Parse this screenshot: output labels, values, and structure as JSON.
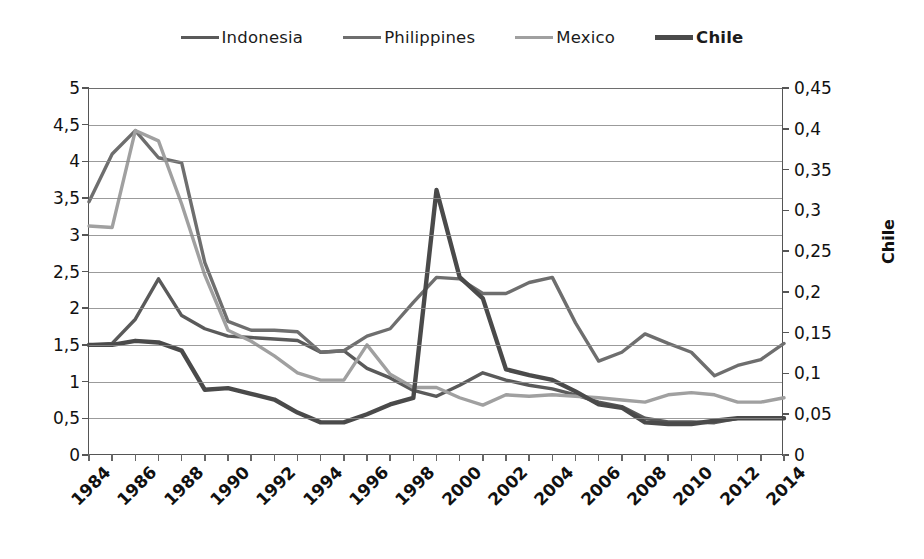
{
  "legend": {
    "items": [
      {
        "label": "Indonesia",
        "color": "#5a5a5a",
        "bold": false,
        "width": 3.4
      },
      {
        "label": "Philippines",
        "color": "#6e6e6e",
        "bold": false,
        "width": 3.4
      },
      {
        "label": "Mexico",
        "color": "#a0a0a0",
        "bold": false,
        "width": 3.4
      },
      {
        "label": "Chile",
        "color": "#4a4a4a",
        "bold": true,
        "width": 4.6
      }
    ]
  },
  "axes": {
    "left_ticks": [
      "5",
      "4,5",
      "4",
      "3,5",
      "3",
      "2,5",
      "2",
      "1,5",
      "1",
      "0,5",
      "0"
    ],
    "right_ticks": [
      "0,45",
      "0,4",
      "0,35",
      "0,3",
      "0,25",
      "0,2",
      "0,15",
      "0,1",
      "0,05",
      "0"
    ],
    "right_title": "Chile",
    "x_labels": [
      "1984",
      "1986",
      "1988",
      "1990",
      "1992",
      "1994",
      "1996",
      "1998",
      "2000",
      "2002",
      "2004",
      "2006",
      "2008",
      "2010",
      "2012",
      "2014"
    ]
  },
  "chart_data": {
    "type": "line",
    "title": "",
    "xlabel": "",
    "ylabel": "",
    "y2label": "Chile",
    "grid": true,
    "legend_position": "top",
    "ylim": [
      0,
      5
    ],
    "y2lim": [
      0,
      0.45
    ],
    "x": [
      1984,
      1985,
      1986,
      1987,
      1988,
      1989,
      1990,
      1991,
      1992,
      1993,
      1994,
      1995,
      1996,
      1997,
      1998,
      1999,
      2000,
      2001,
      2002,
      2003,
      2004,
      2005,
      2006,
      2007,
      2008,
      2009,
      2010,
      2011,
      2012,
      2013,
      2014
    ],
    "series": [
      {
        "name": "Indonesia",
        "axis": "left",
        "color": "#5a5a5a",
        "values": [
          1.5,
          1.52,
          1.85,
          2.4,
          1.9,
          1.72,
          1.62,
          1.6,
          1.58,
          1.56,
          1.4,
          1.42,
          1.18,
          1.05,
          0.88,
          0.8,
          0.95,
          1.12,
          1.02,
          0.95,
          0.9,
          0.82,
          0.72,
          0.66,
          0.5,
          0.45,
          0.45,
          0.44,
          0.5,
          0.5,
          0.5
        ]
      },
      {
        "name": "Philippines",
        "axis": "left",
        "color": "#6e6e6e",
        "values": [
          3.45,
          4.1,
          4.42,
          4.05,
          3.98,
          2.62,
          1.82,
          1.7,
          1.7,
          1.68,
          1.4,
          1.42,
          1.62,
          1.72,
          2.08,
          2.42,
          2.4,
          2.2,
          2.2,
          2.35,
          2.42,
          1.8,
          1.28,
          1.4,
          1.65,
          1.52,
          1.4,
          1.08,
          1.22,
          1.3,
          1.52
        ]
      },
      {
        "name": "Mexico",
        "axis": "left",
        "color": "#a0a0a0",
        "values": [
          3.12,
          3.1,
          4.42,
          4.28,
          3.42,
          2.45,
          1.7,
          1.55,
          1.35,
          1.12,
          1.02,
          1.02,
          1.5,
          1.1,
          0.92,
          0.92,
          0.78,
          0.68,
          0.82,
          0.8,
          0.82,
          0.8,
          0.78,
          0.75,
          0.72,
          0.82,
          0.85,
          0.82,
          0.72,
          0.72,
          0.78
        ]
      },
      {
        "name": "Chile",
        "axis": "right",
        "color": "#4a4a4a",
        "values": [
          0.135,
          0.135,
          0.14,
          0.138,
          0.128,
          0.08,
          0.082,
          0.075,
          0.068,
          0.052,
          0.04,
          0.04,
          0.05,
          0.062,
          0.07,
          0.325,
          0.218,
          0.192,
          0.105,
          0.098,
          0.092,
          0.078,
          0.062,
          0.058,
          0.04,
          0.038,
          0.038,
          0.042,
          0.045,
          0.045,
          0.045
        ]
      }
    ]
  }
}
